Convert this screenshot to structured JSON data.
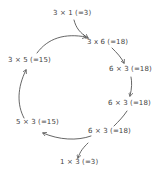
{
  "diagram": {
    "type": "cycle",
    "nodes": [
      {
        "id": "n1",
        "label": "3 × 1 (=3)"
      },
      {
        "id": "n2",
        "label": "3 x 6 (=18)"
      },
      {
        "id": "n3",
        "label": "6 × 3 (=18)"
      },
      {
        "id": "n4",
        "label": "6 × 3 (=18)"
      },
      {
        "id": "n5",
        "label": "6 × 3 (=18)"
      },
      {
        "id": "n6",
        "label": "1 × 3 (=3)"
      },
      {
        "id": "n7",
        "label": "5 × 3 (=15)"
      },
      {
        "id": "n8",
        "label": "3 × 5 (=15)"
      }
    ],
    "edges": [
      {
        "from": "n1",
        "to": "n2"
      },
      {
        "from": "n2",
        "to": "n3"
      },
      {
        "from": "n3",
        "to": "n4"
      },
      {
        "from": "n4",
        "to": "n5"
      },
      {
        "from": "n5",
        "to": "n6"
      },
      {
        "from": "n5",
        "to": "n7"
      },
      {
        "from": "n7",
        "to": "n8"
      },
      {
        "from": "n8",
        "to": "n2"
      }
    ],
    "colors": {
      "stroke": "#555555",
      "text": "#444444",
      "background": "#ffffff"
    }
  }
}
